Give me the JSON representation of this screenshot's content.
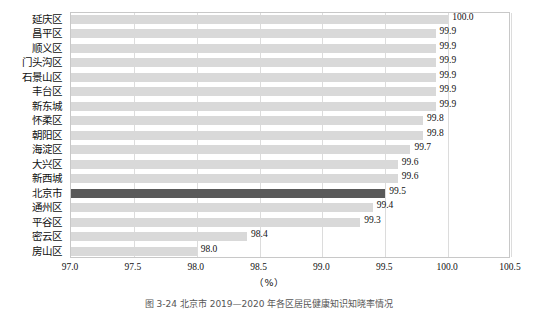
{
  "chart_data": {
    "type": "bar",
    "orientation": "horizontal",
    "title": "",
    "subtitle": "",
    "xlabel": "（%）",
    "ylabel": "",
    "xlim": [
      97.0,
      100.5
    ],
    "xticks": [
      "97.0",
      "97.5",
      "98.0",
      "98.5",
      "99.0",
      "99.5",
      "100.0",
      "100.5"
    ],
    "xtick_values": [
      97.0,
      97.5,
      98.0,
      98.5,
      99.0,
      99.5,
      100.0,
      100.5
    ],
    "grid": "vertical",
    "legend": "none",
    "categories": [
      "延庆区",
      "昌平区",
      "顺义区",
      "门头沟区",
      "石景山区",
      "丰台区",
      "新东城",
      "怀柔区",
      "朝阳区",
      "海淀区",
      "大兴区",
      "新西城",
      "北京市",
      "通州区",
      "平谷区",
      "密云区",
      "房山区"
    ],
    "values": [
      100.0,
      99.9,
      99.9,
      99.9,
      99.9,
      99.9,
      99.9,
      99.8,
      99.8,
      99.7,
      99.6,
      99.6,
      99.5,
      99.4,
      99.3,
      98.4,
      98.0
    ],
    "value_labels": [
      "100.0",
      "99.9",
      "99.9",
      "99.9",
      "99.9",
      "99.9",
      "99.9",
      "99.8",
      "99.8",
      "99.7",
      "99.6",
      "99.6",
      "99.5",
      "99.4",
      "99.3",
      "98.4",
      "98.0"
    ],
    "highlight_category": "北京市",
    "colors": {
      "bar": "#d9d9d9",
      "bar_highlight": "#595959",
      "grid": "#dcdcdc",
      "frame": "#c8c8c8",
      "text": "#111111"
    }
  },
  "caption": {
    "text": "图 3-24  北京市 2019—2020 年各区居民健康知识知晓率情况"
  }
}
